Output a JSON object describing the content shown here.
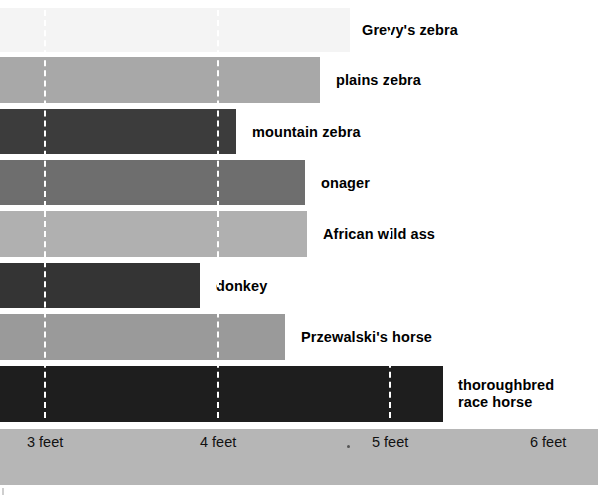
{
  "chart_data": {
    "type": "bar",
    "orientation": "horizontal",
    "title": "",
    "subtitle": "",
    "xlabel": "",
    "ylabel": "",
    "xlim": [
      2.49,
      6.0
    ],
    "xticks": [
      3,
      4,
      5,
      6
    ],
    "xtick_labels": [
      "3 feet",
      "4 feet",
      "5 feet",
      "6 feet"
    ],
    "grid": true,
    "grid_style": "dashed-white-vertical",
    "legend": "none",
    "unit": "feet",
    "note": "Shoulder height of equids; bars are drawn from a clipped left origin, so only the bar end position encodes the value.",
    "categories": [
      "Grevy's zebra",
      "plains zebra",
      "mountain zebra",
      "onager",
      "African wild ass",
      "donkey",
      "Przewalski's horse",
      "thoroughbred race horse"
    ],
    "values": [
      5.0,
      4.6,
      3.9,
      4.5,
      4.5,
      3.6,
      4.3,
      5.6
    ],
    "bar_colors": [
      "#f4f4f4",
      "#a8a8a8",
      "#3c3c3c",
      "#6e6e6e",
      "#b0b0b0",
      "#343434",
      "#9a9a9a",
      "#1e1e1e"
    ],
    "bars": [
      {
        "label": "Grevy's zebra",
        "value": 5.0,
        "color": "#f4f4f4",
        "end_px": 350,
        "top_px": 8,
        "height_px": 44,
        "label_x_px": 362
      },
      {
        "label": "plains zebra",
        "value": 4.6,
        "color": "#a8a8a8",
        "end_px": 320,
        "top_px": 57,
        "height_px": 46,
        "label_x_px": 336
      },
      {
        "label": "mountain zebra",
        "value": 3.9,
        "color": "#3c3c3c",
        "end_px": 236,
        "top_px": 109,
        "height_px": 45,
        "label_x_px": 252
      },
      {
        "label": "onager",
        "value": 4.5,
        "color": "#6e6e6e",
        "end_px": 305,
        "top_px": 160,
        "height_px": 45,
        "label_x_px": 321
      },
      {
        "label": "African wild ass",
        "value": 4.5,
        "color": "#b0b0b0",
        "end_px": 307,
        "top_px": 211,
        "height_px": 46,
        "label_x_px": 323
      },
      {
        "label": "donkey",
        "value": 3.6,
        "color": "#343434",
        "end_px": 200,
        "top_px": 263,
        "height_px": 45,
        "label_x_px": 216
      },
      {
        "label": "Przewalski's horse",
        "value": 4.3,
        "color": "#9a9a9a",
        "end_px": 285,
        "top_px": 314,
        "height_px": 46,
        "label_x_px": 301
      },
      {
        "label": "thoroughbred\nrace horse",
        "value": 5.6,
        "color": "#1e1e1e",
        "end_px": 443,
        "top_px": 366,
        "height_px": 56,
        "label_x_px": 458
      }
    ],
    "gridlines": [
      {
        "label": "3 feet",
        "value": 3,
        "x_px": 44
      },
      {
        "label": "4 feet",
        "value": 4,
        "x_px": 217
      },
      {
        "label": "5 feet",
        "value": 5,
        "x_px": 389
      }
    ],
    "axis": {
      "strip_color": "#b6b6b6",
      "ticks": [
        {
          "label": "3 feet",
          "x_px": 27
        },
        {
          "label": "4 feet",
          "x_px": 200
        },
        {
          "label": "5 feet",
          "x_px": 372
        },
        {
          "label": "6 feet",
          "x_px": 530
        }
      ]
    }
  }
}
